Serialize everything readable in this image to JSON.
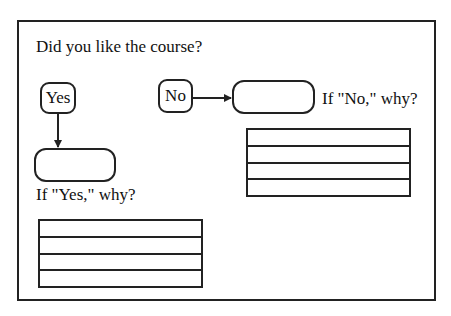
{
  "question": "Did you like the course?",
  "options": {
    "yes": {
      "label": "Yes",
      "followup": "If \"Yes,\" why?",
      "line_count": 4
    },
    "no": {
      "label": "No",
      "followup": "If \"No,\" why?",
      "line_count": 4
    }
  },
  "colors": {
    "stroke": "#222222",
    "background": "#ffffff"
  }
}
